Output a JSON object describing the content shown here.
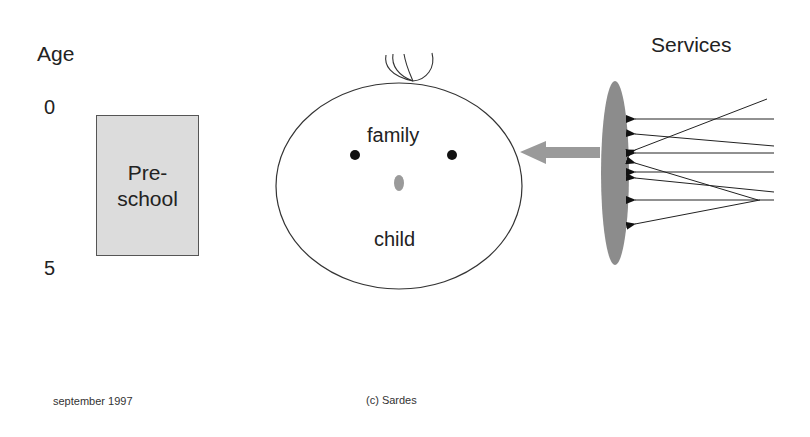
{
  "diagram": {
    "axis": {
      "title": "Age",
      "ticks": [
        "0",
        "5"
      ]
    },
    "preschool_box": {
      "line1": "Pre-",
      "line2": "school",
      "fill": "#dcdcdc"
    },
    "child_face": {
      "top_label": "family",
      "bottom_label": "child"
    },
    "services": {
      "title": "Services",
      "lens_fill": "#8c8c8c",
      "arrow_fill": "#9a9a9a",
      "incoming_arrow_count": 8
    },
    "footer": {
      "date": "september 1997",
      "copyright": "(c) Sardes"
    }
  }
}
